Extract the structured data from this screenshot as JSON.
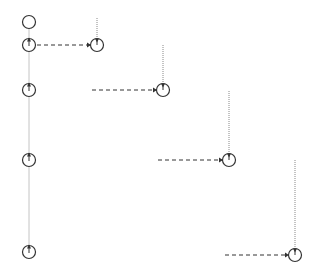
{
  "diagram": {
    "type": "sequence-lifeline-diagram",
    "colors": {
      "stroke": "#333333",
      "lifeline": "#888888",
      "background": "#ffffff"
    },
    "left_lifeline": {
      "x": 29,
      "y_top": 22,
      "y_bottom": 252
    },
    "left_nodes": [
      {
        "x": 29,
        "y": 22,
        "kind": "start"
      },
      {
        "x": 29,
        "y": 45,
        "kind": "activation"
      },
      {
        "x": 29,
        "y": 90,
        "kind": "activation"
      },
      {
        "x": 29,
        "y": 160,
        "kind": "activation"
      },
      {
        "x": 29,
        "y": 252,
        "kind": "activation"
      }
    ],
    "targets": [
      {
        "x": 97,
        "y": 45,
        "line_top": 18,
        "msg_from": 37,
        "msg_to": 90
      },
      {
        "x": 163,
        "y": 90,
        "line_top": 45,
        "msg_from": 92,
        "msg_to": 156
      },
      {
        "x": 229,
        "y": 160,
        "line_top": 91,
        "msg_from": 158,
        "msg_to": 222
      },
      {
        "x": 295,
        "y": 255,
        "line_top": 160,
        "msg_from": 225,
        "msg_to": 288
      }
    ]
  }
}
